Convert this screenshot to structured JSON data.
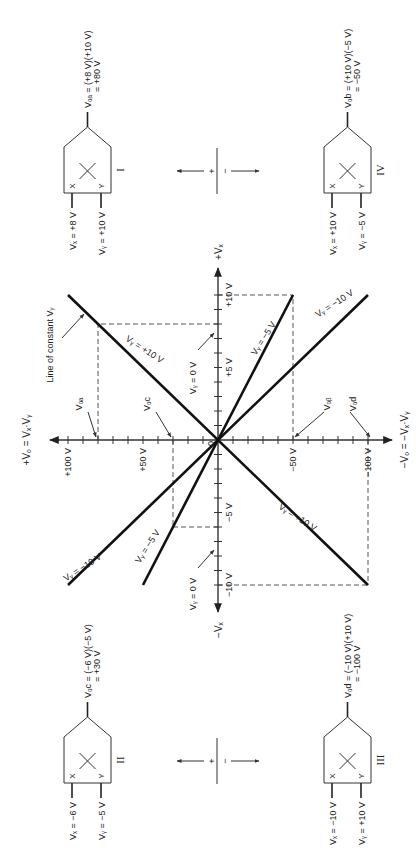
{
  "figure": {
    "orientation": "rotated-90-ccw",
    "colors": {
      "ink": "#222222",
      "background": "#ffffff",
      "dashed": "#444444"
    }
  },
  "graph": {
    "vo_axis_positive_label": "+Vₒ = Vₓ·Vᵧ",
    "vo_axis_negative_label": "−Vₒ = −Vₓ·Vᵧ",
    "vx_axis_positive_label": "+Vₓ",
    "vx_axis_negative_label": "−Vₓ",
    "origin_label": "0",
    "vo_ticks": [
      {
        "value": 100,
        "label": "+100 V"
      },
      {
        "value": 50,
        "label": "+50 V"
      },
      {
        "value": -50,
        "label": "−50 V"
      },
      {
        "value": -100,
        "label": "−100 V"
      }
    ],
    "vx_ticks": [
      {
        "value": 10,
        "label": "+10 V"
      },
      {
        "value": 5,
        "label": "+5 V"
      },
      {
        "value": -5,
        "label": "−5 V"
      },
      {
        "value": -10,
        "label": "−10 V"
      }
    ],
    "lines": [
      {
        "vy": 10,
        "label": "Vᵧ = +10 V"
      },
      {
        "vy": -5,
        "label": "Vᵧ = −5 V"
      },
      {
        "vy": -10,
        "label": "Vᵧ = −10 V"
      }
    ],
    "vy_zero_label": "Vᵧ = 0 V",
    "constant_line_label": "Line of constant Vᵧ",
    "operating_points": [
      {
        "name": "Voa",
        "label": "Vₒₐ",
        "vx": 8,
        "vo": 80
      },
      {
        "name": "Vob",
        "label": "Vₒᵦ",
        "vx": 10,
        "vo": -50
      },
      {
        "name": "Voc",
        "label": "Vₒc",
        "vx": -6,
        "vo": 30
      },
      {
        "name": "Vod",
        "label": "Vₒd",
        "vx": -10,
        "vo": -100
      }
    ]
  },
  "multipliers": [
    {
      "id": "I",
      "vx": "Vₓ = +8 V",
      "vy": "Vᵧ = +10 V",
      "out1": "Vₒₐ = (+8 V)(+10 V)",
      "out2": "= +80 V"
    },
    {
      "id": "IV",
      "vx": "Vₓ = +10 V",
      "vy": "Vᵧ = −5 V",
      "out1": "Vₒb = (+10 V)(−5 V)",
      "out2": "= −50 V"
    },
    {
      "id": "II",
      "vx": "Vₓ = −6 V",
      "vy": "Vᵧ = −5 V",
      "out1": "Vₒc = (−6 V)(−5 V)",
      "out2": "= +30 V"
    },
    {
      "id": "III",
      "vx": "Vₓ = −10 V",
      "vy": "Vᵧ = +10 V",
      "out1": "Vₒd = (−10 V)(+10 V)",
      "out2": "= −100 V"
    }
  ],
  "input_label_x": "X",
  "input_label_y": "Y",
  "polarity": {
    "plus": "+",
    "minus": "−"
  }
}
